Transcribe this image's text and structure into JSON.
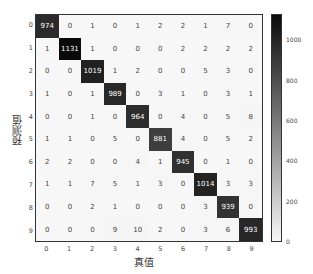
{
  "chart_data": {
    "type": "heatmap",
    "title": "",
    "xlabel": "真值",
    "ylabel": "预测值",
    "x_ticks": [
      "0",
      "1",
      "2",
      "3",
      "4",
      "5",
      "6",
      "7",
      "8",
      "9"
    ],
    "y_ticks": [
      "0",
      "1",
      "2",
      "3",
      "4",
      "5",
      "6",
      "7",
      "8",
      "9"
    ],
    "matrix": [
      [
        974,
        0,
        1,
        0,
        1,
        2,
        2,
        1,
        7,
        0
      ],
      [
        1,
        1131,
        1,
        0,
        0,
        0,
        2,
        2,
        2,
        2
      ],
      [
        0,
        0,
        1019,
        1,
        2,
        0,
        0,
        5,
        3,
        0
      ],
      [
        1,
        0,
        1,
        989,
        0,
        3,
        1,
        0,
        3,
        1
      ],
      [
        0,
        0,
        1,
        0,
        964,
        0,
        4,
        0,
        5,
        8
      ],
      [
        1,
        1,
        0,
        5,
        0,
        881,
        4,
        0,
        5,
        2
      ],
      [
        2,
        2,
        0,
        0,
        4,
        1,
        945,
        0,
        1,
        0
      ],
      [
        1,
        1,
        7,
        5,
        1,
        3,
        0,
        1014,
        3,
        3
      ],
      [
        0,
        0,
        2,
        1,
        0,
        0,
        0,
        3,
        939,
        0
      ],
      [
        0,
        0,
        0,
        9,
        10,
        2,
        0,
        3,
        6,
        993
      ]
    ],
    "colormap": "Greys",
    "colorbar": {
      "ticks": [
        "0",
        "200",
        "400",
        "600",
        "800",
        "1000"
      ],
      "range": [
        0,
        1131
      ]
    },
    "grid": false,
    "legend": "none"
  }
}
